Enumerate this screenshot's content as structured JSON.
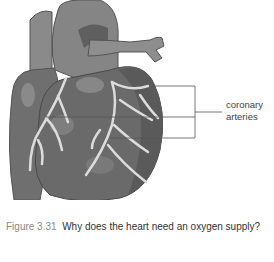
{
  "figure": {
    "label": {
      "line1": "coronary",
      "line2": "arteries"
    }
  },
  "caption": {
    "number": "Figure 3.31",
    "text": "Why does the heart need an oxygen supply?"
  },
  "colors": {
    "heart_dark": "#5a5a5a",
    "heart_mid": "#7a7a7a",
    "heart_light": "#9a9a9a",
    "artery": "#d8d8d8",
    "label_line": "#666666",
    "caption_number": "#8a8a8a",
    "caption_text": "#333333"
  }
}
